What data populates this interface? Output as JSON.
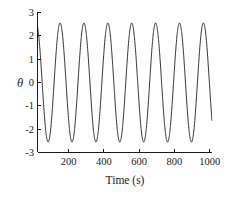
{
  "chart_data": {
    "type": "line",
    "title": "",
    "xlabel": "Time (s)",
    "ylabel": "θ",
    "xlim": [
      0,
      1030
    ],
    "ylim": [
      -3,
      3
    ],
    "xticks": [
      200,
      400,
      600,
      800,
      1000
    ],
    "xtick_labels": [
      "200",
      "400",
      "600",
      "800",
      "1000"
    ],
    "yticks": [
      3,
      2,
      1,
      0,
      -1,
      -2,
      -3
    ],
    "ytick_labels": [
      "3",
      "2",
      "1",
      "0",
      "-1",
      "-2",
      "-3"
    ],
    "grid": false,
    "legend": null,
    "series": [
      {
        "name": "theta",
        "description": "Undamped pendulum angular displacement oscillation",
        "amplitude": 2.55,
        "period": 141,
        "phase_start_value": 2.4,
        "line_color": "#1a1a1a",
        "peaks": [
          {
            "x": 8,
            "y": 2.55
          },
          {
            "x": 149,
            "y": 2.55
          },
          {
            "x": 290,
            "y": 2.55
          },
          {
            "x": 431,
            "y": 2.55
          },
          {
            "x": 572,
            "y": 2.55
          },
          {
            "x": 713,
            "y": 2.55
          },
          {
            "x": 854,
            "y": 2.55
          },
          {
            "x": 995,
            "y": 2.55
          }
        ],
        "troughs": [
          {
            "x": 78,
            "y": -2.55
          },
          {
            "x": 219,
            "y": -2.55
          },
          {
            "x": 360,
            "y": -2.55
          },
          {
            "x": 501,
            "y": -2.55
          },
          {
            "x": 642,
            "y": -2.55
          },
          {
            "x": 783,
            "y": -2.55
          },
          {
            "x": 924,
            "y": -2.55
          }
        ]
      }
    ]
  },
  "axes": {
    "y_label": "θ",
    "x_label": "Time (s)"
  }
}
